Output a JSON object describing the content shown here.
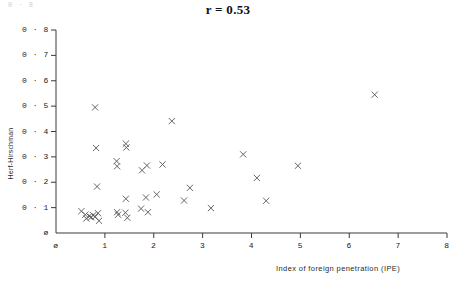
{
  "figure": {
    "title": "r = 0.53",
    "corner_artifact": "0 · 8",
    "xlabel": "Index of foreign penetration (IPE)",
    "ylabel": "Herf-Hirschman"
  },
  "chart_data": {
    "type": "scatter",
    "title": "r = 0.53",
    "xlabel": "Index of foreign penetration (IPE)",
    "ylabel": "Herf-Hirschman",
    "correlation": 0.53,
    "xlim": [
      0,
      8
    ],
    "ylim": [
      0,
      0.8
    ],
    "grid": false,
    "legend": null,
    "marker": "x",
    "xticks": [
      0,
      1,
      2,
      3,
      4,
      5,
      6,
      7,
      8
    ],
    "xtick_labels": [
      "ø",
      "1",
      "2",
      "3",
      "4",
      "5",
      "6",
      "7",
      "8"
    ],
    "yticks": [
      0,
      0.1,
      0.2,
      0.3,
      0.4,
      0.5,
      0.6,
      0.7,
      0.8
    ],
    "ytick_labels": [
      "ø",
      "0 · 1",
      "0 · 2",
      "0 · 3",
      "0 · 4",
      "0 · 5",
      "0 · 6",
      "0 · 7",
      "0 · 8"
    ],
    "points": [
      {
        "x": 0.52,
        "y": 0.086
      },
      {
        "x": 0.6,
        "y": 0.072
      },
      {
        "x": 0.62,
        "y": 0.057
      },
      {
        "x": 0.68,
        "y": 0.066
      },
      {
        "x": 0.72,
        "y": 0.062
      },
      {
        "x": 0.76,
        "y": 0.07
      },
      {
        "x": 0.8,
        "y": 0.064
      },
      {
        "x": 0.86,
        "y": 0.078
      },
      {
        "x": 0.88,
        "y": 0.048
      },
      {
        "x": 0.8,
        "y": 0.495
      },
      {
        "x": 0.82,
        "y": 0.335
      },
      {
        "x": 0.84,
        "y": 0.183
      },
      {
        "x": 1.24,
        "y": 0.283
      },
      {
        "x": 1.25,
        "y": 0.263
      },
      {
        "x": 1.43,
        "y": 0.352
      },
      {
        "x": 1.44,
        "y": 0.337
      },
      {
        "x": 1.43,
        "y": 0.135
      },
      {
        "x": 1.25,
        "y": 0.082
      },
      {
        "x": 1.27,
        "y": 0.072
      },
      {
        "x": 1.42,
        "y": 0.08
      },
      {
        "x": 1.46,
        "y": 0.06
      },
      {
        "x": 1.74,
        "y": 0.096
      },
      {
        "x": 1.76,
        "y": 0.247
      },
      {
        "x": 1.86,
        "y": 0.266
      },
      {
        "x": 1.84,
        "y": 0.14
      },
      {
        "x": 1.88,
        "y": 0.082
      },
      {
        "x": 2.06,
        "y": 0.152
      },
      {
        "x": 2.18,
        "y": 0.27
      },
      {
        "x": 2.37,
        "y": 0.441
      },
      {
        "x": 2.62,
        "y": 0.128
      },
      {
        "x": 2.74,
        "y": 0.178
      },
      {
        "x": 3.17,
        "y": 0.098
      },
      {
        "x": 3.83,
        "y": 0.31
      },
      {
        "x": 4.11,
        "y": 0.217
      },
      {
        "x": 4.3,
        "y": 0.127
      },
      {
        "x": 4.95,
        "y": 0.265
      },
      {
        "x": 6.52,
        "y": 0.545
      }
    ]
  }
}
